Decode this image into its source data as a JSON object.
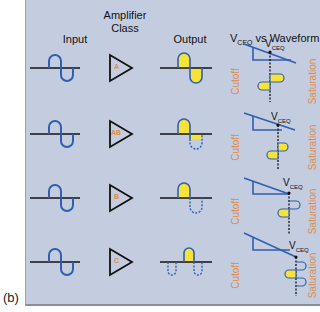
{
  "figure_label": "(b)",
  "headers": {
    "input": "Input",
    "amp_line1": "Amplifier",
    "amp_line2": "Class",
    "output": "Output",
    "vceq_prefix": "V",
    "vceq_sub": "CEQ",
    "vceq_suffix": " vs Waveform"
  },
  "rows": [
    {
      "class": "A",
      "vceq_label": "V",
      "vceq_sub": "CEQ",
      "cutoff": "Cutoff",
      "saturation": "Saturation"
    },
    {
      "class": "AB",
      "vceq_label": "V",
      "vceq_sub": "CEQ",
      "cutoff": "Cutoff",
      "saturation": "Saturation"
    },
    {
      "class": "B",
      "vceq_label": "V",
      "vceq_sub": "CEQ",
      "cutoff": "Cutoff",
      "saturation": "Saturation"
    },
    {
      "class": "C",
      "vceq_label": "V",
      "vceq_sub": "CEQ",
      "cutoff": "Cutoff",
      "saturation": "Saturation"
    }
  ],
  "colors": {
    "background": "#c4cde0",
    "wave": "#2f5fb0",
    "fill": "#f5e23a",
    "label_orange": "#e08a4a",
    "axis": "#111111"
  }
}
